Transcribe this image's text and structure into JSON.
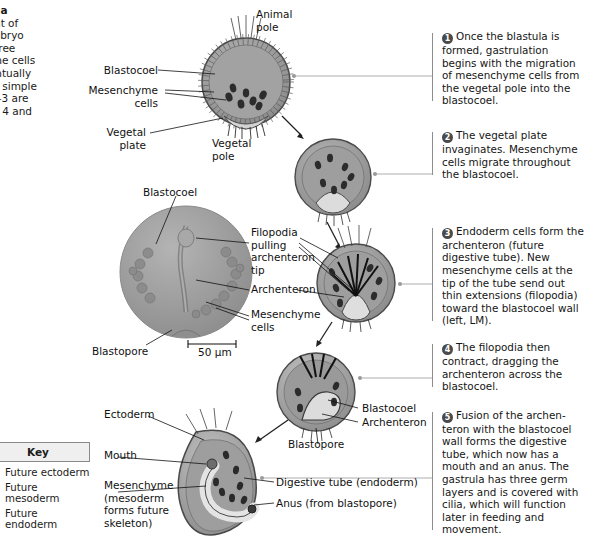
{
  "figure": {
    "title_fragment": "lation in a",
    "intro_lines": [
      "movement of",
      "ms an embryo",
      "be and three",
      "esenchyme cells",
      ") will eventually",
      "nd form a simple",
      "n steps 1–3 are",
      "e in steps 4 and"
    ]
  },
  "steps": [
    {
      "n": "1",
      "text": "Once the blastula is formed, gastrulation begins with the migration of mesenchyme cells from the vegetal pole into the blastocoel."
    },
    {
      "n": "2",
      "text": "The vegetal plate invaginates. Mesenchyme cells migrate throughout the blastocoel."
    },
    {
      "n": "3",
      "text": "Endoderm cells form the archenteron (future digestive tube). New mesenchyme cells at the tip of the tube send out thin extensions (filopodia) toward the blastocoel wall (left, LM)."
    },
    {
      "n": "4",
      "text": "The filopodia then contract, dragging the archenteron across the blastocoel."
    },
    {
      "n": "5",
      "text": "Fusion of the archen-teron with the blastocoel wall forms the digestive tube, which now has a mouth and an anus. The gastrula has three germ layers and is covered with cilia, which will function later in feeding and movement."
    }
  ],
  "key": {
    "title": "Key",
    "items": [
      {
        "label": "Future ectoderm",
        "color": "#c9c9c9"
      },
      {
        "label": "Future mesoderm",
        "color": "#8f8f8f"
      },
      {
        "label": "Future endoderm",
        "color": "#5e5e5e"
      }
    ]
  },
  "labels": {
    "animal_pole": "Animal\npole",
    "blastocoel_1": "Blastocoel",
    "mesenchyme_cells_1": "Mesenchyme\ncells",
    "vegetal_plate": "Vegetal\nplate",
    "vegetal_pole": "Vegetal\npole",
    "blastocoel_lm": "Blastocoel",
    "filopodia": "Filopodia\npulling\narchenteron\ntip",
    "archenteron_lm": "Archenteron",
    "mesenchyme_cells_lm": "Mesenchyme\ncells",
    "blastopore_lm": "Blastopore",
    "scale_bar": "50 µm",
    "blastocoel_4": "Blastocoel",
    "archenteron_4": "Archenteron",
    "blastopore_4": "Blastopore",
    "ectoderm": "Ectoderm",
    "mouth": "Mouth",
    "mesenchyme_gastrula": "Mesenchyme\n(mesoderm\nforms future\nskeleton)",
    "digestive_tube": "Digestive tube (endoderm)",
    "anus": "Anus (from blastopore)"
  },
  "colors": {
    "ectoderm": "#c9c9c9",
    "mesoderm": "#8f8f8f",
    "endoderm": "#5e5e5e",
    "outline": "#3a3a3a",
    "micrograph": "#9a9a9a",
    "leader": "#9a9a9a"
  }
}
